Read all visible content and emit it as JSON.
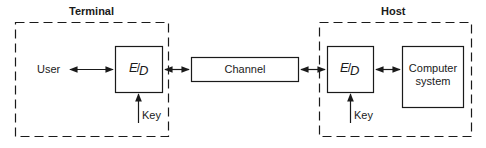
{
  "diagram": {
    "groups": [
      {
        "id": "terminal",
        "title": "Terminal"
      },
      {
        "id": "host",
        "title": "Host"
      }
    ],
    "nodes": {
      "user": {
        "label": "User"
      },
      "terminal_ed": {
        "label_top": "E",
        "label_bottom": "D",
        "separator": "/"
      },
      "terminal_key": {
        "label": "Key"
      },
      "channel": {
        "label": "Channel"
      },
      "host_ed": {
        "label_top": "E",
        "label_bottom": "D",
        "separator": "/"
      },
      "host_key": {
        "label": "Key"
      },
      "computer_system": {
        "line1": "Computer",
        "line2": "system"
      }
    },
    "edges": [
      {
        "from": "User",
        "to": "E/D (Terminal)",
        "type": "bidirectional"
      },
      {
        "from": "E/D (Terminal)",
        "to": "Channel",
        "type": "bidirectional"
      },
      {
        "from": "Channel",
        "to": "E/D (Host)",
        "type": "bidirectional"
      },
      {
        "from": "E/D (Host)",
        "to": "Computer system",
        "type": "bidirectional"
      },
      {
        "from": "Key",
        "to": "E/D (Terminal)",
        "type": "directed"
      },
      {
        "from": "Key",
        "to": "E/D (Host)",
        "type": "directed"
      }
    ],
    "colors": {
      "stroke": "#1a1a1a",
      "background": "#ffffff"
    }
  }
}
